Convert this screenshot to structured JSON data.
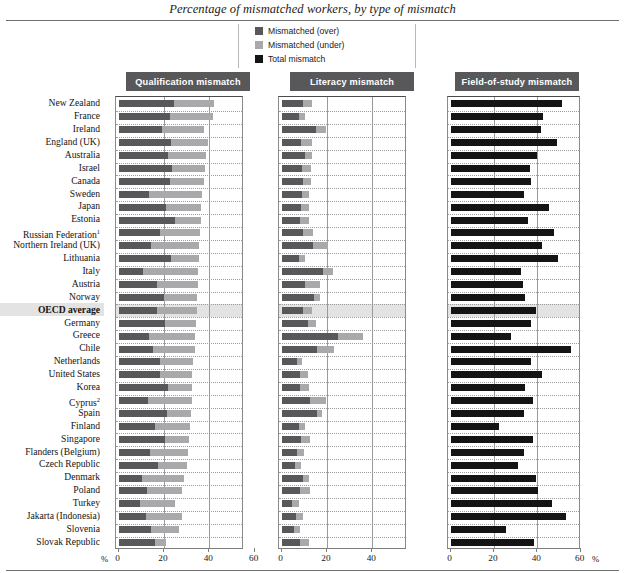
{
  "title": "Percentage of mismatched workers, by type of mismatch",
  "legend": {
    "items": [
      {
        "label": "Mismatched (over)",
        "color": "#58585a",
        "icon": "square-swatch-icon"
      },
      {
        "label": "Mismatched (under)",
        "color": "#a9a9ab",
        "icon": "square-swatch-icon"
      },
      {
        "label": "Total mismatch",
        "color": "#141414",
        "icon": "square-swatch-icon"
      }
    ]
  },
  "axis": {
    "unit_label": "%",
    "ticks_panel1": [
      "0",
      "20",
      "40",
      "60"
    ],
    "ticks_panel2": [
      "0",
      "20",
      "40",
      "60"
    ],
    "ticks_panel3": [
      "0",
      "20",
      "40",
      "60"
    ]
  },
  "chart_data": {
    "type": "bar",
    "orientation": "horizontal",
    "title": "Percentage of mismatched workers, by type of mismatch",
    "xlabel": "%",
    "ylabel": "",
    "xlim": [
      0,
      70
    ],
    "grid": true,
    "legend_position": "top-center",
    "highlight_category": "OECD average",
    "panels": [
      {
        "name": "Qualification mismatch",
        "stacked": true,
        "series": [
          {
            "name": "Mismatched (over)",
            "color": "#58585a"
          },
          {
            "name": "Mismatched (under)",
            "color": "#a9a9ab"
          }
        ]
      },
      {
        "name": "Literacy mismatch",
        "stacked": true,
        "series": [
          {
            "name": "Mismatched (over)",
            "color": "#58585a"
          },
          {
            "name": "Mismatched (under)",
            "color": "#a9a9ab"
          }
        ]
      },
      {
        "name": "Field-of-study mismatch",
        "stacked": false,
        "series": [
          {
            "name": "Total mismatch",
            "color": "#141414"
          }
        ]
      }
    ],
    "categories": [
      "New Zealand",
      "France",
      "Ireland",
      "England (UK)",
      "Australia",
      "Israel",
      "Canada",
      "Sweden",
      "Japan",
      "Estonia",
      "Russian Federation",
      "Northern Ireland (UK)",
      "Lithuania",
      "Italy",
      "Austria",
      "Norway",
      "OECD average",
      "Germany",
      "Greece",
      "Chile",
      "Netherlands",
      "United States",
      "Korea",
      "Cyprus",
      "Spain",
      "Finland",
      "Singapore",
      "Flanders (Belgium)",
      "Czech Republic",
      "Denmark",
      "Poland",
      "Turkey",
      "Jakarta (Indonesia)",
      "Slovenia",
      "Slovak Republic"
    ],
    "category_footnotes": {
      "Russian Federation": "1",
      "Cyprus": "2"
    },
    "data": [
      {
        "category": "New Zealand",
        "qual_over": 24.5,
        "qual_under": 17.5,
        "lit_over": 9.5,
        "lit_under": 4.0,
        "field_total": 51.5
      },
      {
        "category": "France",
        "qual_over": 22.5,
        "qual_under": 19.0,
        "lit_over": 7.5,
        "lit_under": 3.0,
        "field_total": 42.5
      },
      {
        "category": "Ireland",
        "qual_over": 19.0,
        "qual_under": 18.5,
        "lit_over": 15.0,
        "lit_under": 4.5,
        "field_total": 41.5
      },
      {
        "category": "England (UK)",
        "qual_over": 23.0,
        "qual_under": 16.5,
        "lit_over": 8.5,
        "lit_under": 5.0,
        "field_total": 49.0
      },
      {
        "category": "Australia",
        "qual_over": 22.0,
        "qual_under": 16.5,
        "lit_over": 10.5,
        "lit_under": 3.0,
        "field_total": 40.0
      },
      {
        "category": "Israel",
        "qual_over": 23.5,
        "qual_under": 14.5,
        "lit_over": 9.0,
        "lit_under": 4.0,
        "field_total": 36.5
      },
      {
        "category": "Canada",
        "qual_over": 22.5,
        "qual_under": 15.0,
        "lit_over": 9.5,
        "lit_under": 3.5,
        "field_total": 37.0
      },
      {
        "category": "Sweden",
        "qual_over": 13.5,
        "qual_under": 23.5,
        "lit_over": 9.0,
        "lit_under": 3.0,
        "field_total": 34.0
      },
      {
        "category": "Japan",
        "qual_over": 21.0,
        "qual_under": 15.5,
        "lit_over": 8.5,
        "lit_under": 3.5,
        "field_total": 45.5
      },
      {
        "category": "Estonia",
        "qual_over": 25.0,
        "qual_under": 11.5,
        "lit_over": 8.0,
        "lit_under": 4.0,
        "field_total": 35.5
      },
      {
        "category": "Russian Federation",
        "qual_over": 18.5,
        "qual_under": 17.5,
        "lit_over": 9.5,
        "lit_under": 4.5,
        "field_total": 47.5
      },
      {
        "category": "Northern Ireland (UK)",
        "qual_over": 14.5,
        "qual_under": 21.0,
        "lit_over": 14.0,
        "lit_under": 6.5,
        "field_total": 42.0
      },
      {
        "category": "Lithuania",
        "qual_over": 23.0,
        "qual_under": 12.5,
        "lit_over": 7.5,
        "lit_under": 3.0,
        "field_total": 49.5
      },
      {
        "category": "Italy",
        "qual_over": 11.0,
        "qual_under": 24.0,
        "lit_over": 18.5,
        "lit_under": 4.0,
        "field_total": 32.5
      },
      {
        "category": "Austria",
        "qual_over": 17.0,
        "qual_under": 18.0,
        "lit_over": 10.5,
        "lit_under": 6.5,
        "field_total": 33.5
      },
      {
        "category": "Norway",
        "qual_over": 20.0,
        "qual_under": 14.5,
        "lit_over": 14.5,
        "lit_under": 2.5,
        "field_total": 34.5
      },
      {
        "category": "OECD average",
        "qual_over": 17.0,
        "qual_under": 17.5,
        "lit_over": 9.5,
        "lit_under": 4.0,
        "field_total": 39.5
      },
      {
        "category": "Germany",
        "qual_over": 20.5,
        "qual_under": 13.5,
        "lit_over": 11.5,
        "lit_under": 3.5,
        "field_total": 37.0
      },
      {
        "category": "Greece",
        "qual_over": 13.5,
        "qual_under": 20.0,
        "lit_over": 25.0,
        "lit_under": 11.0,
        "field_total": 28.0
      },
      {
        "category": "Chile",
        "qual_over": 15.0,
        "qual_under": 18.5,
        "lit_over": 15.5,
        "lit_under": 7.5,
        "field_total": 55.5
      },
      {
        "category": "Netherlands",
        "qual_over": 18.5,
        "qual_under": 14.5,
        "lit_over": 7.0,
        "lit_under": 2.0,
        "field_total": 37.0
      },
      {
        "category": "United States",
        "qual_over": 18.5,
        "qual_under": 14.0,
        "lit_over": 8.0,
        "lit_under": 3.5,
        "field_total": 42.0
      },
      {
        "category": "Korea",
        "qual_over": 22.0,
        "qual_under": 10.5,
        "lit_over": 8.0,
        "lit_under": 4.0,
        "field_total": 34.5
      },
      {
        "category": "Cyprus",
        "qual_over": 13.0,
        "qual_under": 19.5,
        "lit_over": 12.5,
        "lit_under": 7.0,
        "field_total": 38.0
      },
      {
        "category": "Spain",
        "qual_over": 21.5,
        "qual_under": 10.5,
        "lit_over": 15.5,
        "lit_under": 2.5,
        "field_total": 34.0
      },
      {
        "category": "Finland",
        "qual_over": 16.0,
        "qual_under": 15.5,
        "lit_over": 7.5,
        "lit_under": 3.0,
        "field_total": 22.5
      },
      {
        "category": "Singapore",
        "qual_over": 20.5,
        "qual_under": 10.5,
        "lit_over": 8.5,
        "lit_under": 4.0,
        "field_total": 38.0
      },
      {
        "category": "Flanders (Belgium)",
        "qual_over": 14.0,
        "qual_under": 16.5,
        "lit_over": 7.0,
        "lit_under": 3.0,
        "field_total": 34.0
      },
      {
        "category": "Czech Republic",
        "qual_over": 17.5,
        "qual_under": 12.5,
        "lit_over": 6.0,
        "lit_under": 2.5,
        "field_total": 31.0
      },
      {
        "category": "Denmark",
        "qual_over": 10.5,
        "qual_under": 18.5,
        "lit_over": 9.5,
        "lit_under": 2.5,
        "field_total": 39.5
      },
      {
        "category": "Poland",
        "qual_over": 12.5,
        "qual_under": 15.5,
        "lit_over": 8.0,
        "lit_under": 4.5,
        "field_total": 40.5
      },
      {
        "category": "Turkey",
        "qual_over": 9.5,
        "qual_under": 15.5,
        "lit_over": 4.5,
        "lit_under": 3.0,
        "field_total": 47.0
      },
      {
        "category": "Jakarta (Indonesia)",
        "qual_over": 12.0,
        "qual_under": 16.0,
        "lit_over": 6.5,
        "lit_under": 3.0,
        "field_total": 53.0
      },
      {
        "category": "Slovenia",
        "qual_over": 14.5,
        "qual_under": 12.0,
        "lit_over": 5.5,
        "lit_under": 2.5,
        "field_total": 25.5
      },
      {
        "category": "Slovak Republic",
        "qual_over": 16.0,
        "qual_under": 5.0,
        "lit_over": 8.0,
        "lit_under": 4.0,
        "field_total": 38.5
      }
    ]
  }
}
